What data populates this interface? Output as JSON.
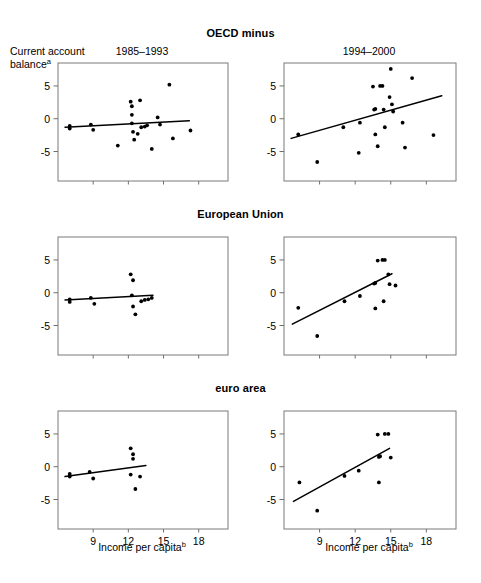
{
  "figure": {
    "ylabel_line1": "Current account",
    "ylabel_line2": "balance",
    "ylabel_sup": "a",
    "xlabel": "Income per capita",
    "xlabel_sup": "b",
    "left_period": "1985–1993",
    "right_period": "1994–2000",
    "row_titles": [
      "OECD minus",
      "European Union",
      "euro area"
    ],
    "line_color": "#000000",
    "point_color": "#000000",
    "frame_color": "#7a7a7a"
  },
  "chart_data": [
    {
      "id": "oecd-1985-1993",
      "type": "scatter",
      "title": "1985–1993",
      "group": "OECD minus",
      "xlabel": "Income per capita",
      "ylabel": "Current account balance",
      "xlim": [
        6.0,
        20.5
      ],
      "ylim": [
        -9.5,
        8.5
      ],
      "xticks": [
        9,
        12,
        15,
        18
      ],
      "yticks": [
        -5,
        0,
        5
      ],
      "grid": false,
      "points": [
        {
          "x": 7.0,
          "y": -1.1
        },
        {
          "x": 7.0,
          "y": -1.5
        },
        {
          "x": 8.8,
          "y": -0.9
        },
        {
          "x": 9.0,
          "y": -1.7
        },
        {
          "x": 11.1,
          "y": -4.1
        },
        {
          "x": 12.2,
          "y": 2.6
        },
        {
          "x": 12.3,
          "y": 1.9
        },
        {
          "x": 12.3,
          "y": 0.6
        },
        {
          "x": 12.3,
          "y": -0.7
        },
        {
          "x": 12.4,
          "y": -2.0
        },
        {
          "x": 12.5,
          "y": -3.2
        },
        {
          "x": 12.8,
          "y": -2.3
        },
        {
          "x": 13.0,
          "y": 2.8
        },
        {
          "x": 13.1,
          "y": -1.3
        },
        {
          "x": 13.4,
          "y": -1.2
        },
        {
          "x": 13.6,
          "y": -1.0
        },
        {
          "x": 14.0,
          "y": -4.6
        },
        {
          "x": 14.5,
          "y": 0.2
        },
        {
          "x": 14.7,
          "y": -0.9
        },
        {
          "x": 15.5,
          "y": 5.2
        },
        {
          "x": 15.8,
          "y": -3.0
        },
        {
          "x": 17.3,
          "y": -1.8
        }
      ],
      "fit_line": {
        "x0": 6.6,
        "y0": -1.3,
        "x1": 17.2,
        "y1": -0.3
      }
    },
    {
      "id": "oecd-1994-2000",
      "type": "scatter",
      "title": "1994–2000",
      "group": "OECD minus",
      "xlabel": "Income per capita",
      "ylabel": "Current account balance",
      "xlim": [
        6.0,
        20.5
      ],
      "ylim": [
        -9.5,
        8.5
      ],
      "xticks": [
        9,
        12,
        15,
        18
      ],
      "yticks": [
        -5,
        0,
        5
      ],
      "grid": false,
      "points": [
        {
          "x": 7.2,
          "y": -2.4
        },
        {
          "x": 8.8,
          "y": -6.6
        },
        {
          "x": 11.0,
          "y": -1.3
        },
        {
          "x": 12.3,
          "y": -5.2
        },
        {
          "x": 12.4,
          "y": -0.6
        },
        {
          "x": 13.5,
          "y": 4.9
        },
        {
          "x": 13.6,
          "y": 1.4
        },
        {
          "x": 13.7,
          "y": 1.5
        },
        {
          "x": 13.7,
          "y": -2.4
        },
        {
          "x": 13.9,
          "y": -4.2
        },
        {
          "x": 14.1,
          "y": 5.0
        },
        {
          "x": 14.3,
          "y": 5.0
        },
        {
          "x": 14.4,
          "y": 1.4
        },
        {
          "x": 14.5,
          "y": -1.3
        },
        {
          "x": 14.9,
          "y": 3.3
        },
        {
          "x": 15.0,
          "y": 7.6
        },
        {
          "x": 15.1,
          "y": 2.2
        },
        {
          "x": 15.2,
          "y": 1.1
        },
        {
          "x": 16.0,
          "y": -0.6
        },
        {
          "x": 16.2,
          "y": -4.4
        },
        {
          "x": 16.8,
          "y": 6.2
        },
        {
          "x": 18.6,
          "y": -2.5
        }
      ],
      "fit_line": {
        "x0": 6.6,
        "y0": -3.0,
        "x1": 19.3,
        "y1": 3.5
      }
    },
    {
      "id": "eu-1985-1993",
      "type": "scatter",
      "title": "1985–1993",
      "group": "European Union",
      "xlabel": "Income per capita",
      "ylabel": "Current account balance",
      "xlim": [
        6.0,
        20.5
      ],
      "ylim": [
        -9.5,
        8.5
      ],
      "xticks": [
        9,
        12,
        15,
        18
      ],
      "yticks": [
        -5,
        0,
        5
      ],
      "grid": false,
      "points": [
        {
          "x": 7.0,
          "y": -1.0
        },
        {
          "x": 7.0,
          "y": -1.4
        },
        {
          "x": 8.8,
          "y": -0.8
        },
        {
          "x": 9.1,
          "y": -1.7
        },
        {
          "x": 12.2,
          "y": 2.8
        },
        {
          "x": 12.4,
          "y": 1.9
        },
        {
          "x": 12.3,
          "y": -0.4
        },
        {
          "x": 12.4,
          "y": -2.1
        },
        {
          "x": 12.6,
          "y": -3.3
        },
        {
          "x": 13.1,
          "y": -1.3
        },
        {
          "x": 13.4,
          "y": -1.1
        },
        {
          "x": 13.7,
          "y": -1.0
        },
        {
          "x": 14.0,
          "y": -0.8
        }
      ],
      "fit_line": {
        "x0": 6.6,
        "y0": -1.1,
        "x1": 14.1,
        "y1": -0.4
      }
    },
    {
      "id": "eu-1994-2000",
      "type": "scatter",
      "title": "1994–2000",
      "group": "European Union",
      "xlabel": "Income per capita",
      "ylabel": "Current account balance",
      "xlim": [
        6.0,
        20.5
      ],
      "ylim": [
        -9.5,
        8.5
      ],
      "xticks": [
        9,
        12,
        15,
        18
      ],
      "yticks": [
        -5,
        0,
        5
      ],
      "grid": false,
      "points": [
        {
          "x": 7.2,
          "y": -2.3
        },
        {
          "x": 8.8,
          "y": -6.6
        },
        {
          "x": 11.1,
          "y": -1.3
        },
        {
          "x": 12.4,
          "y": -0.5
        },
        {
          "x": 13.6,
          "y": 1.4
        },
        {
          "x": 13.7,
          "y": 1.5
        },
        {
          "x": 13.7,
          "y": -2.4
        },
        {
          "x": 13.9,
          "y": 4.9
        },
        {
          "x": 14.3,
          "y": 5.0
        },
        {
          "x": 14.5,
          "y": 5.0
        },
        {
          "x": 14.4,
          "y": -1.3
        },
        {
          "x": 14.8,
          "y": 2.8
        },
        {
          "x": 14.9,
          "y": 1.3
        },
        {
          "x": 15.4,
          "y": 1.1
        }
      ],
      "fit_line": {
        "x0": 6.7,
        "y0": -4.8,
        "x1": 15.1,
        "y1": 2.9
      }
    },
    {
      "id": "euro-1985-1993",
      "type": "scatter",
      "title": "1985–1993",
      "group": "euro area",
      "xlabel": "Income per capita",
      "ylabel": "Current account balance",
      "xlim": [
        6.0,
        20.5
      ],
      "ylim": [
        -9.5,
        8.5
      ],
      "xticks": [
        9,
        12,
        15,
        18
      ],
      "yticks": [
        -5,
        0,
        5
      ],
      "grid": false,
      "points": [
        {
          "x": 7.0,
          "y": -1.1
        },
        {
          "x": 7.0,
          "y": -1.5
        },
        {
          "x": 8.7,
          "y": -0.8
        },
        {
          "x": 9.0,
          "y": -1.8
        },
        {
          "x": 12.2,
          "y": 2.8
        },
        {
          "x": 12.4,
          "y": 1.9
        },
        {
          "x": 12.4,
          "y": 1.2
        },
        {
          "x": 12.2,
          "y": -1.2
        },
        {
          "x": 12.6,
          "y": -3.4
        },
        {
          "x": 13.0,
          "y": -1.5
        }
      ],
      "fit_line": {
        "x0": 6.6,
        "y0": -1.5,
        "x1": 13.5,
        "y1": 0.2
      }
    },
    {
      "id": "euro-1994-2000",
      "type": "scatter",
      "title": "1994–2000",
      "group": "euro area",
      "xlabel": "Income per capita",
      "ylabel": "Current account balance",
      "xlim": [
        6.0,
        20.5
      ],
      "ylim": [
        -9.5,
        8.5
      ],
      "xticks": [
        9,
        12,
        15,
        18
      ],
      "yticks": [
        -5,
        0,
        5
      ],
      "grid": false,
      "points": [
        {
          "x": 7.3,
          "y": -2.4
        },
        {
          "x": 8.8,
          "y": -6.7
        },
        {
          "x": 11.1,
          "y": -1.4
        },
        {
          "x": 12.3,
          "y": -0.6
        },
        {
          "x": 13.9,
          "y": 4.9
        },
        {
          "x": 14.0,
          "y": 1.5
        },
        {
          "x": 14.1,
          "y": 1.6
        },
        {
          "x": 14.0,
          "y": -2.4
        },
        {
          "x": 14.5,
          "y": 5.0
        },
        {
          "x": 14.8,
          "y": 5.0
        },
        {
          "x": 15.0,
          "y": 1.4
        }
      ],
      "fit_line": {
        "x0": 6.8,
        "y0": -5.3,
        "x1": 14.9,
        "y1": 2.8
      }
    }
  ]
}
